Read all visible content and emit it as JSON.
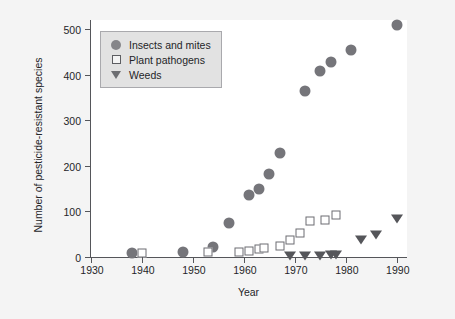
{
  "chart_data": {
    "type": "scatter",
    "title": "",
    "xlabel": "Year",
    "ylabel": "Number of pesticide-resistant species",
    "xlim": [
      1930,
      1992
    ],
    "ylim": [
      0,
      520
    ],
    "xticks": [
      1930,
      1940,
      1950,
      1960,
      1970,
      1980,
      1990
    ],
    "yticks": [
      0,
      100,
      200,
      300,
      400,
      500
    ],
    "grid": false,
    "legend_position": "top-left",
    "series": [
      {
        "name": "Insects and mites",
        "marker": "circle",
        "color": "#75757a",
        "points": [
          {
            "x": 1938,
            "y": 8
          },
          {
            "x": 1948,
            "y": 10
          },
          {
            "x": 1954,
            "y": 22
          },
          {
            "x": 1957,
            "y": 75
          },
          {
            "x": 1961,
            "y": 136
          },
          {
            "x": 1963,
            "y": 150
          },
          {
            "x": 1965,
            "y": 182
          },
          {
            "x": 1967,
            "y": 228
          },
          {
            "x": 1972,
            "y": 364
          },
          {
            "x": 1975,
            "y": 408
          },
          {
            "x": 1977,
            "y": 428
          },
          {
            "x": 1981,
            "y": 455
          },
          {
            "x": 1990,
            "y": 508
          }
        ]
      },
      {
        "name": "Plant pathogens",
        "marker": "square",
        "color": "#6c6d72",
        "points": [
          {
            "x": 1940,
            "y": 8
          },
          {
            "x": 1953,
            "y": 10
          },
          {
            "x": 1959,
            "y": 12
          },
          {
            "x": 1961,
            "y": 14
          },
          {
            "x": 1963,
            "y": 18
          },
          {
            "x": 1964,
            "y": 20
          },
          {
            "x": 1967,
            "y": 24
          },
          {
            "x": 1969,
            "y": 38
          },
          {
            "x": 1971,
            "y": 52
          },
          {
            "x": 1973,
            "y": 78
          },
          {
            "x": 1976,
            "y": 82
          },
          {
            "x": 1978,
            "y": 92
          }
        ]
      },
      {
        "name": "Weeds",
        "marker": "triangle",
        "color": "#55565a",
        "points": [
          {
            "x": 1969,
            "y": 2
          },
          {
            "x": 1972,
            "y": 2
          },
          {
            "x": 1975,
            "y": 2
          },
          {
            "x": 1977,
            "y": 4
          },
          {
            "x": 1978,
            "y": 4
          },
          {
            "x": 1983,
            "y": 38
          },
          {
            "x": 1986,
            "y": 48
          },
          {
            "x": 1990,
            "y": 84
          }
        ]
      }
    ]
  }
}
